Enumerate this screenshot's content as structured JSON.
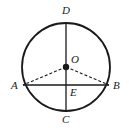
{
  "figure": {
    "type": "circle-geometry-diagram",
    "canvas": {
      "width": 132,
      "height": 132,
      "background": "#ffffff"
    },
    "stroke_color": "#1a1a1a",
    "circle": {
      "center_x": 66,
      "center_y": 67,
      "radius": 44,
      "stroke_width": 1.8,
      "fill": "none"
    },
    "points": {
      "O": {
        "label": "O",
        "x": 66,
        "y": 67,
        "marker": "filled-dot",
        "marker_radius": 3.2
      },
      "D": {
        "label": "D",
        "x": 66,
        "y": 23,
        "marker": "none"
      },
      "C": {
        "label": "C",
        "x": 66,
        "y": 111,
        "marker": "none"
      },
      "A": {
        "label": "A",
        "x": 23,
        "y": 85,
        "marker": "none"
      },
      "B": {
        "label": "B",
        "x": 109,
        "y": 85,
        "marker": "none"
      },
      "E": {
        "label": "E",
        "x": 66,
        "y": 85,
        "marker": "none"
      }
    },
    "segments": [
      {
        "name": "diameter-DC",
        "from": "D",
        "to": "C",
        "style": "solid",
        "width": 1.3
      },
      {
        "name": "chord-AB",
        "from": "A",
        "to": "B",
        "style": "solid",
        "width": 1.3
      },
      {
        "name": "radius-OA",
        "from": "O",
        "to": "A",
        "style": "dashed",
        "width": 1.1,
        "dash": "3,2"
      },
      {
        "name": "radius-OB",
        "from": "O",
        "to": "B",
        "style": "dashed",
        "width": 1.1,
        "dash": "3,2"
      }
    ],
    "labels": [
      {
        "name": "label-D",
        "text": "D",
        "left": 62,
        "top": 5
      },
      {
        "name": "label-O",
        "text": "O",
        "left": 71,
        "top": 54
      },
      {
        "name": "label-A",
        "text": "A",
        "left": 11,
        "top": 80
      },
      {
        "name": "label-B",
        "text": "B",
        "left": 113,
        "top": 80
      },
      {
        "name": "label-E",
        "text": "E",
        "left": 70,
        "top": 87
      },
      {
        "name": "label-C",
        "text": "C",
        "left": 62,
        "top": 114
      }
    ]
  }
}
